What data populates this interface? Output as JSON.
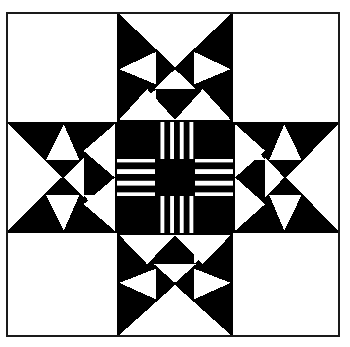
{
  "artwork": {
    "title": "Quilt Block Pattern",
    "subtitle": "Eight-pointed star with checkerboard center",
    "type": "monochrome-geometric-quilt-block",
    "caption": ""
  },
  "colors": {
    "ink": "#000000",
    "paper": "#ffffff",
    "frame_stroke": "#1a1a1a",
    "stripe_dark": "#000000",
    "stripe_light": "#ffffff"
  },
  "canvas": {
    "width": 350,
    "height": 347,
    "background": "#ffffff"
  },
  "frame": {
    "name": "outer-border",
    "x": 6,
    "y": 12,
    "width": 334,
    "height": 325,
    "stroke_width": 2
  },
  "grid": {
    "columns": 3,
    "rows": 3,
    "col_edges": [
      6,
      117,
      233,
      340
    ],
    "row_edges": [
      12,
      122,
      233,
      337
    ],
    "cells": [
      {
        "name": "cell-top-left",
        "row": 0,
        "col": 0,
        "fill": "plain-white"
      },
      {
        "name": "cell-top-center",
        "row": 0,
        "col": 1,
        "fill": "star-point-north"
      },
      {
        "name": "cell-top-right",
        "row": 0,
        "col": 2,
        "fill": "plain-white"
      },
      {
        "name": "cell-middle-left",
        "row": 1,
        "col": 0,
        "fill": "star-point-west"
      },
      {
        "name": "cell-center",
        "row": 1,
        "col": 1,
        "fill": "striped-nine-patch"
      },
      {
        "name": "cell-middle-right",
        "row": 1,
        "col": 2,
        "fill": "star-point-east"
      },
      {
        "name": "cell-bottom-left",
        "row": 2,
        "col": 0,
        "fill": "plain-white"
      },
      {
        "name": "cell-bottom-center",
        "row": 2,
        "col": 1,
        "fill": "star-point-south"
      },
      {
        "name": "cell-bottom-right",
        "row": 2,
        "col": 2,
        "fill": "plain-white"
      }
    ]
  },
  "center_block": {
    "name": "striped-nine-patch",
    "x": 117,
    "y": 122,
    "size": 116,
    "sub_grid": 3,
    "patches": [
      {
        "pos": "top-left",
        "kind": "solid"
      },
      {
        "pos": "top-center",
        "kind": "vertical-stripes"
      },
      {
        "pos": "top-right",
        "kind": "solid"
      },
      {
        "pos": "middle-left",
        "kind": "horizontal-stripes"
      },
      {
        "pos": "middle-center",
        "kind": "solid"
      },
      {
        "pos": "middle-right",
        "kind": "horizontal-stripes"
      },
      {
        "pos": "bottom-left",
        "kind": "solid"
      },
      {
        "pos": "bottom-center",
        "kind": "vertical-stripes"
      },
      {
        "pos": "bottom-right",
        "kind": "solid"
      }
    ],
    "vertical_stripe_count": 12,
    "horizontal_stripe_count": 10,
    "stripe_pitch_px": 3.2
  },
  "star_point": {
    "description": "Black square containing a large white wedge plus four white triangles forming a pinwheel-flower star point",
    "orientation_labels": [
      "north",
      "east",
      "south",
      "west"
    ],
    "rotations_deg": [
      0,
      90,
      180,
      270
    ]
  }
}
